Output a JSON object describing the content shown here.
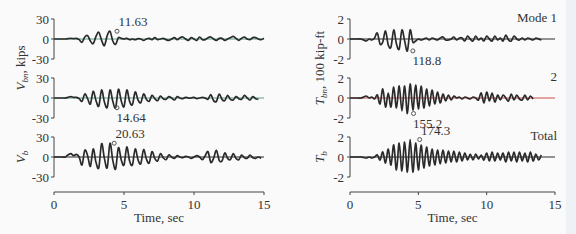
{
  "chart_data": [
    {
      "type": "line",
      "panel": "left",
      "xlabel": "Time, sec",
      "x_ticks": [
        "0",
        "5",
        "10",
        "15"
      ],
      "xlim": [
        0,
        15
      ],
      "ylabel_shared": "V_bn, kips",
      "subplots": [
        {
          "name": "V_b1 (Mode 1)",
          "ylabel": "",
          "ylim": [
            -30,
            30
          ],
          "y_ticks": [
            "30",
            "0",
            "-30"
          ],
          "zero_line_color": "#5aa08c",
          "peak": {
            "label": "11.63",
            "t": 4.5,
            "value": 11.63
          },
          "series": {
            "t_start": 0,
            "dt": 0.2,
            "values": [
              0,
              0,
              0,
              0,
              0,
              0.5,
              1,
              0.5,
              1,
              -1,
              -5,
              3,
              5,
              -3,
              -7,
              4,
              10,
              -2,
              -10,
              5,
              11.63,
              -3,
              -8,
              2,
              1,
              0,
              1,
              -1,
              0,
              -1,
              0.5,
              0,
              -2,
              0,
              1,
              -1,
              2,
              -1,
              0,
              1,
              -1,
              -2,
              0,
              2,
              -1,
              2,
              3,
              0,
              -2,
              2,
              0,
              -2,
              3,
              -1,
              -1,
              2,
              3,
              0,
              -2,
              1,
              1,
              -2,
              0,
              2,
              4,
              1,
              -2,
              1,
              3,
              0,
              -1,
              2,
              2,
              0,
              -1,
              1
            ]
          }
        },
        {
          "name": "V_b2 (Mode 2)",
          "ylabel": "",
          "ylim": [
            -30,
            30
          ],
          "y_ticks": [
            "30",
            "0",
            "-30"
          ],
          "zero_line_color": "#5aa08c",
          "peak": {
            "label": "14.64",
            "t": 4.5,
            "value": -14.64
          },
          "series": {
            "t_start": 0,
            "dt": 0.2,
            "values": [
              0,
              0,
              0,
              0,
              0,
              1,
              2,
              1,
              1,
              -1,
              -5,
              6,
              -1,
              -9,
              10,
              -4,
              -12,
              12,
              -6,
              -14,
              12,
              -5,
              -14.64,
              13,
              -4,
              -13,
              12,
              -5,
              -10,
              9,
              -3,
              -7,
              6,
              -2,
              -5,
              4,
              -1,
              -4,
              3,
              -1,
              -2,
              2,
              0,
              -3,
              2,
              0,
              -1,
              1,
              0,
              0,
              1,
              -1,
              0,
              1,
              0,
              -2,
              5,
              -4,
              -5,
              6,
              -2,
              -4,
              4,
              -2,
              -3,
              2,
              -1,
              -2,
              4,
              0,
              -3,
              2,
              -1,
              -2
            ]
          }
        },
        {
          "name": "V_b (Total)",
          "ylabel": "V_b",
          "ylim": [
            -30,
            30
          ],
          "y_ticks": [
            "30",
            "0",
            "-30"
          ],
          "zero_line_color": "#2a2a2a",
          "peak": {
            "label": "20.63",
            "t": 4.3,
            "value": 20.63
          },
          "series": {
            "t_start": 0,
            "dt": 0.2,
            "values": [
              0,
              0,
              0,
              0,
              0,
              3,
              5,
              2,
              4,
              0,
              -12,
              10,
              2,
              -14,
              12,
              -8,
              -16,
              20,
              -2,
              -16,
              20.63,
              -5,
              -18,
              14,
              -4,
              -12,
              15,
              -6,
              -12,
              12,
              -4,
              -10,
              11,
              -3,
              -9,
              8,
              -2,
              -6,
              5,
              -1,
              -4,
              3,
              0,
              -2,
              2,
              0,
              -1,
              1,
              0,
              -2,
              0,
              2,
              0,
              -4,
              2,
              8,
              -8,
              -2,
              10,
              -5,
              -6,
              6,
              -2,
              -4,
              5,
              -2,
              -4,
              3,
              -1,
              -2,
              3,
              -1,
              -2,
              0,
              -2
            ]
          }
        }
      ]
    },
    {
      "type": "line",
      "panel": "right",
      "xlabel": "Time, sec",
      "x_ticks": [
        "0",
        "5",
        "10",
        "15"
      ],
      "xlim": [
        0,
        15
      ],
      "ylabel_shared": "T_bn, 100 kip-ft",
      "subplots": [
        {
          "name": "T_b1",
          "legend": "Mode 1",
          "ylim": [
            -2,
            2
          ],
          "y_ticks": [
            "2",
            "0",
            "-2"
          ],
          "zero_line_color": "#2a2a2a",
          "peak": {
            "label": "118.8",
            "t": 4.6,
            "value": -1.188
          },
          "series": {
            "t_start": 0,
            "dt": 0.2,
            "values": [
              0,
              0,
              0,
              0,
              0,
              -0.1,
              -0.2,
              0,
              -0.1,
              0.1,
              0.6,
              -0.5,
              -0.3,
              0.8,
              -0.6,
              -0.8,
              0.9,
              -0.5,
              -1,
              0.9,
              -0.2,
              -1.188,
              0.9,
              -0.3,
              -0.2,
              0,
              -0.1,
              0,
              0.1,
              -0.1,
              0.1,
              0,
              -0.1,
              0.1,
              0.2,
              -0.1,
              -0.1,
              0,
              0.2,
              -0.1,
              0.1,
              0.1,
              -0.2,
              0.3,
              0,
              -0.2,
              0.3,
              -0.1,
              0.1,
              -0.2,
              0.3,
              0,
              -0.2,
              0.3,
              -0.1,
              0.1,
              -0.2,
              0.4,
              -0.1,
              -0.2,
              0.3,
              0,
              -0.1,
              0.1,
              -0.1,
              0.1,
              0,
              -0.1,
              0.1,
              0,
              -0.1
            ]
          }
        },
        {
          "name": "T_b2",
          "legend": "2",
          "ylim": [
            -2,
            2
          ],
          "y_ticks": [
            "2",
            "0",
            "-2"
          ],
          "zero_line_color": "#c8504a",
          "peak": {
            "label": "155.2",
            "t": 4.65,
            "value": -1.552
          },
          "series": {
            "t_start": 0,
            "dt": 0.2,
            "values": [
              0,
              0,
              0,
              0,
              0,
              0.1,
              0.2,
              0,
              0.1,
              -0.1,
              0.3,
              -0.6,
              0.9,
              -0.9,
              0.5,
              -0.9,
              1.1,
              -1,
              1.2,
              -1.3,
              1.2,
              -1.552,
              1.4,
              -1.2,
              1.3,
              -1.1,
              1.2,
              -1,
              0.9,
              -0.8,
              0.8,
              -0.6,
              0.6,
              -0.5,
              0.4,
              -0.3,
              0.3,
              -0.2,
              0.2,
              0,
              0.1,
              -0.1,
              0.1,
              0,
              -0.1,
              0.1,
              0,
              -0.2,
              0.5,
              -0.5,
              0.6,
              -0.3,
              0.5,
              -0.4,
              0.3,
              -0.2,
              0.3,
              0,
              -0.3,
              0.4,
              -0.2,
              0.3,
              -0.1,
              -0.2,
              0.3,
              -0.2,
              0.2,
              -0.1
            ]
          }
        },
        {
          "name": "T_b",
          "ylabel": "T_b",
          "legend": "Total",
          "ylim": [
            -2,
            2
          ],
          "y_ticks": [
            "2",
            "0",
            "-2"
          ],
          "zero_line_color": "#2a2a2a",
          "peak": {
            "label": "174.3",
            "t": 5.1,
            "value": 1.743
          },
          "series": {
            "t_start": 0,
            "dt": 0.2,
            "values": [
              0,
              0,
              0,
              0,
              0,
              -0.05,
              -0.1,
              0,
              -0.1,
              0,
              0.2,
              -0.3,
              0.5,
              -0.6,
              0.8,
              -0.8,
              1.2,
              -1.3,
              1.4,
              -1.4,
              1.5,
              -1.5,
              1.743,
              -1.5,
              1.4,
              -1.3,
              1.2,
              -1.1,
              1,
              -0.9,
              0.8,
              -0.8,
              0.7,
              -0.7,
              0.7,
              -0.6,
              0.6,
              -0.5,
              0.6,
              -0.5,
              0.5,
              -0.4,
              0.4,
              -0.3,
              0.3,
              -0.3,
              0.3,
              -0.2,
              0.2,
              -0.3,
              0.4,
              -0.4,
              0.5,
              -0.4,
              0.4,
              -0.3,
              0.4,
              -0.5,
              0.5,
              -0.4,
              0.5,
              -0.5,
              0.5,
              -0.4,
              0.4,
              -0.5,
              0.5,
              -0.4,
              0.3,
              -0.3,
              0.2
            ]
          }
        }
      ]
    }
  ],
  "labels": {
    "left_ylabel": "V",
    "left_ylabel_sub": "bn",
    "left_ylabel_unit": ", kips",
    "left_vb": "V",
    "left_vb_sub": "b",
    "right_ylabel": "T",
    "right_ylabel_sub": "bn",
    "right_ylabel_unit": ", 100 kip-ft",
    "right_tb": "T",
    "right_tb_sub": "b"
  }
}
